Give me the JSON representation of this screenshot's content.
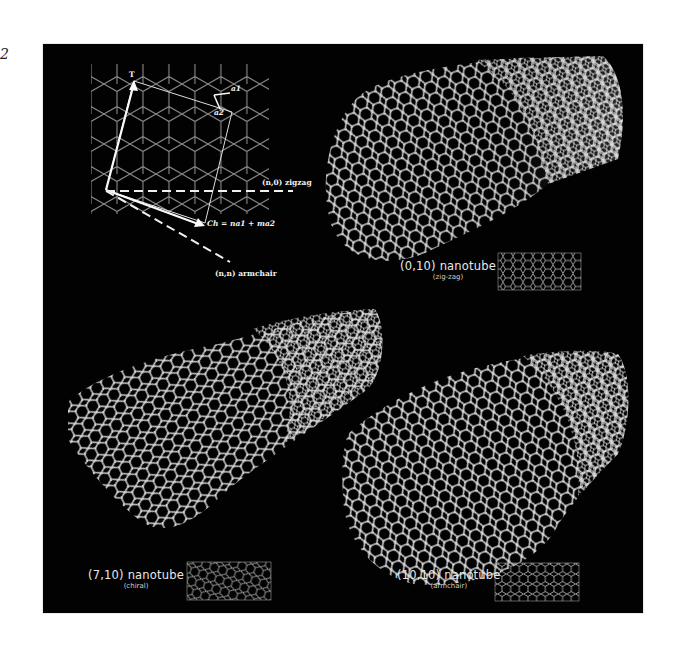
{
  "figure": {
    "margin_mark": "2",
    "background": "#020202",
    "foreground": "#e8e8e8"
  },
  "lattice_diagram": {
    "translation_vector_label": "T",
    "unit_vector_a1_label": "a1",
    "unit_vector_a2_label": "a2",
    "zigzag_label": "(n,0) zigzag",
    "chiral_vector_label": "Ch = na1 + ma2",
    "armchair_label": "(n,n) armchair"
  },
  "nanotubes": [
    {
      "title": "(0,10) nanotube",
      "subtitle": "(zig-zag)",
      "type": "zigzag"
    },
    {
      "title": "(7,10) nanotube",
      "subtitle": "(chiral)",
      "type": "chiral"
    },
    {
      "title": "(10,10) nanotube",
      "subtitle": "(armchair)",
      "type": "armchair"
    }
  ]
}
